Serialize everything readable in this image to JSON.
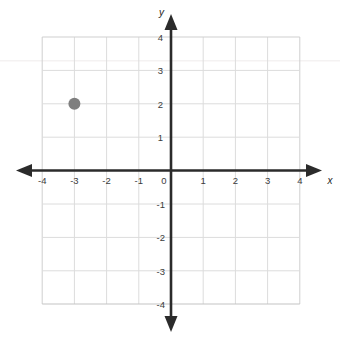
{
  "chart_data": {
    "type": "scatter",
    "title": "",
    "subtitle": "",
    "xlabel": "x",
    "ylabel": "y",
    "xlim": [
      -4,
      4
    ],
    "ylim": [
      -4,
      4
    ],
    "grid": true,
    "legend": null,
    "legend_position": "none",
    "x_tick_labels": [
      "-4",
      "-3",
      "-2",
      "-1",
      "0",
      "1",
      "2",
      "3",
      "4"
    ],
    "y_tick_labels": [
      "4",
      "3",
      "2",
      "1",
      "-1",
      "-2",
      "-3",
      "-4"
    ],
    "x_ticks": [
      -4,
      -3,
      -2,
      -1,
      0,
      1,
      2,
      3,
      4
    ],
    "y_ticks": [
      4,
      3,
      2,
      1,
      -1,
      -2,
      -3,
      -4
    ],
    "origin_label": "0",
    "points": [
      {
        "label": "plotted-point",
        "x": -3,
        "y": 2,
        "color": "#7f7f7f",
        "radius": 6
      }
    ],
    "series": [
      {
        "name": "plotted point",
        "x": [
          -3
        ],
        "y": [
          2
        ],
        "marker": "filled-circle",
        "color": "#7f7f7f"
      }
    ],
    "annotations": [],
    "colors": {
      "axis": "#2b2b2b",
      "grid": "#d8d8d8",
      "grid_border": "#c9c9c9",
      "point": "#7f7f7f",
      "background": "#ffffff",
      "tick_text": "#3b3b3b"
    }
  },
  "axes": {
    "x_axis_name": "x",
    "y_axis_name": "y"
  }
}
